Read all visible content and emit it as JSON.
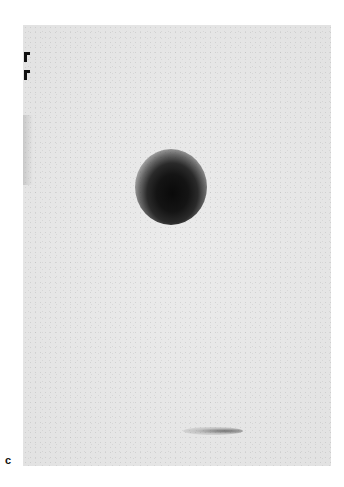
{
  "figure": {
    "panel_label": "c",
    "markers": [
      "corner-marker",
      "corner-marker"
    ],
    "colors": {
      "background": "#e6e6e6",
      "hotspot": "#0a0a0a",
      "marker": "#111111"
    }
  }
}
